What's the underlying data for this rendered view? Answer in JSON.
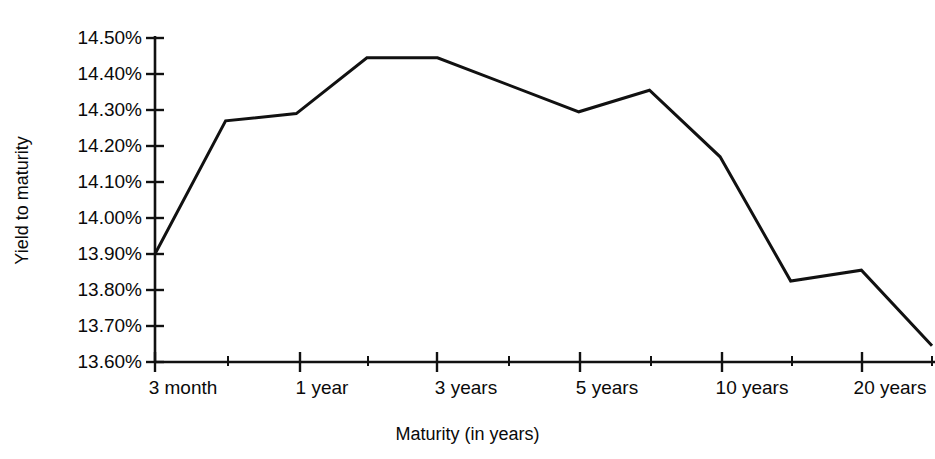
{
  "chart_data": {
    "type": "line",
    "title": "",
    "xlabel": "Maturity (in years)",
    "ylabel": "Yield to maturity",
    "grid": false,
    "legend": "none",
    "ylim": [
      13.6,
      14.5
    ],
    "y_tick_labels": [
      "14.50%",
      "14.40%",
      "14.30%",
      "14.20%",
      "14.10%",
      "14.00%",
      "13.90%",
      "13.80%",
      "13.70%",
      "13.60%"
    ],
    "y_tick_values": [
      14.5,
      14.4,
      14.3,
      14.2,
      14.1,
      14.0,
      13.9,
      13.8,
      13.7,
      13.6
    ],
    "x_tick_labels": [
      "3 month",
      "1 year",
      "3 years",
      "5 years",
      "10 years",
      "20 years"
    ],
    "x_major_positions": [
      0,
      2,
      4,
      6,
      8,
      10
    ],
    "x_minor_positions": [
      1,
      3,
      5,
      7,
      9,
      11
    ],
    "x_units": "index",
    "series": [
      {
        "name": "Yield curve",
        "color": "#111111",
        "line_width": 3,
        "x": [
          0,
          1,
          2,
          3,
          4,
          6,
          7,
          8,
          9,
          10,
          11
        ],
        "values": [
          13.9,
          14.27,
          14.29,
          14.445,
          14.445,
          14.295,
          14.355,
          14.17,
          13.825,
          13.855,
          13.645
        ],
        "point_labels": [
          "13.90%",
          "14.27%",
          "14.29%",
          "14.45%",
          "14.45%",
          "14.30%",
          "14.36%",
          "14.17%",
          "13.83%",
          "13.86%",
          "13.65%"
        ]
      }
    ]
  },
  "axes": {
    "y_title": "Yield to maturity",
    "x_title": "Maturity (in years)"
  }
}
